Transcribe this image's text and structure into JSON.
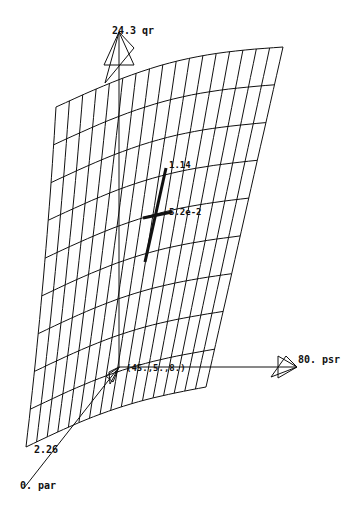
{
  "chart_data": {
    "type": "surface3d",
    "title": "",
    "axes": {
      "vertical": {
        "name": "qr",
        "max_label": "24.3 qr",
        "max": 24.3
      },
      "right": {
        "name": "psr",
        "max_label": "80. psr",
        "max": 80
      },
      "depth": {
        "name": "par",
        "min_label": "0. par",
        "min": 0,
        "near_label": "2.26",
        "near_value": 2.26
      }
    },
    "origin_label": "(45.,5.,8.)",
    "marked_point": {
      "upper_label": "1.14",
      "center_label": "5.2e-2",
      "upper_value": 1.14,
      "center_value": 0.052
    },
    "mesh": {
      "rows": 9,
      "cols": 17,
      "corners": {
        "top_left": [
          56,
          107
        ],
        "top_right": [
          283,
          47
        ],
        "bottom_right": [
          206,
          387
        ],
        "bottom_left": [
          36,
          447
        ]
      }
    },
    "grid": false,
    "legend": "none"
  },
  "labels": {
    "qr_axis": "24.3 qr",
    "psr_axis": "80. psr",
    "par_axis": "0. par",
    "par_tick": "2.26",
    "origin": "(45.,5.,8.)",
    "point_upper": "1.14",
    "point_center": "5.2e-2"
  },
  "colors": {
    "ink": "#111111",
    "background": "#ffffff"
  }
}
